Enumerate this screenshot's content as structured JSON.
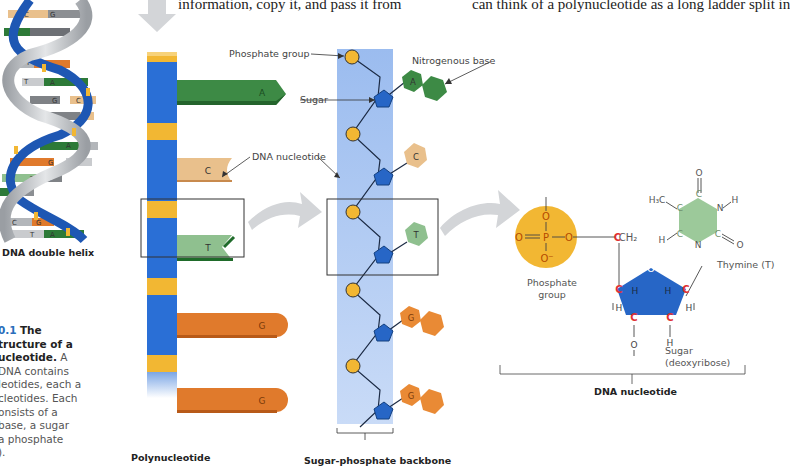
{
  "body_text": {
    "line_left": "information, copy it, and pass it from",
    "line_right": "can think of a polynucleotide as a long ladder split in"
  },
  "helix": {
    "label": "DNA double helix",
    "base_pairs": [
      {
        "left": "C",
        "right": "G"
      },
      {
        "left": "T",
        "right": "A"
      },
      {
        "left": "C",
        "right": "G"
      },
      {
        "left": "T",
        "right": "A"
      },
      {
        "left": "G",
        "right": "C"
      },
      {
        "left": "G",
        "right": "C"
      },
      {
        "left": "A",
        "right": "T"
      },
      {
        "left": "G",
        "right": "C"
      },
      {
        "left": "T",
        "right": "A"
      },
      {
        "left": "T",
        "right": "A"
      },
      {
        "left": "C",
        "right": "G"
      },
      {
        "left": "T",
        "right": "A"
      }
    ]
  },
  "caption": {
    "figure_number": "0.1",
    "title_line1": "The",
    "title_line2": "tructure of a",
    "title_line3": "ucleotide.",
    "line3_tail": "A",
    "lines": [
      " DNA contains",
      "leotides, each a",
      "cleotides. Each",
      "onsists of a",
      " base, a sugar",
      "a phosphate",
      ")."
    ]
  },
  "polynucleotide": {
    "label": "Polynucleotide",
    "bases": [
      "A",
      "C",
      "T",
      "G",
      "G"
    ]
  },
  "backbone": {
    "label": "Sugar-phosphate backbone",
    "bases": [
      "A",
      "C",
      "T",
      "G",
      "G"
    ],
    "callouts": {
      "phosphate_group": "Phosphate group",
      "sugar": "Sugar",
      "nitrogenous_base": "Nitrogenous base",
      "dna_nucleotide": "DNA nucleotide"
    }
  },
  "nucleotide_detail": {
    "label": "DNA nucleotide",
    "phosphate_label_line1": "Phosphate",
    "phosphate_label_line2": "group",
    "phosphate_atoms": {
      "top": "O",
      "left": "O",
      "center": "P",
      "right": "O",
      "bottom": "O⁻"
    },
    "ch2": "CH₂",
    "base_name": "Thymine (T)",
    "base_atoms": {
      "methyl": "H₃C",
      "h_left": "H",
      "n_h": "H",
      "o_top": "O",
      "o_right": "O",
      "n": "N",
      "c": "C"
    },
    "sugar_label_line1": "Sugar",
    "sugar_label_line2": "(deoxyribose)",
    "ring_oxygen": "O",
    "hydroxyl_o": "O",
    "h": "H",
    "carbon": "C"
  },
  "colors": {
    "backbone_blue": "#2a6fd6",
    "backbone_band": "#9bbcef",
    "phosphate_yellow": "#f2b733",
    "sugar_blue": "#2766c6",
    "adenine_green": "#3d8a45",
    "cytosine_tan": "#e9c08c",
    "thymine_green": "#8fc08f",
    "guanine_orange": "#e07a2c",
    "carbon_red": "#e03030",
    "arrow_gray": "#d3d5d8"
  }
}
